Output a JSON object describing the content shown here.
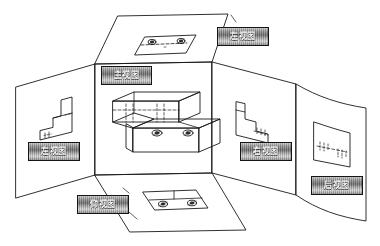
{
  "figure": {
    "type": "engineering-drawing",
    "background_color": "#ffffff",
    "line_color": "#1a1a1a",
    "plate_text_color": "#efefef"
  },
  "labels": {
    "top_view": "俯视图",
    "top_right_view": "左视图",
    "front_view": "主视图",
    "left_view": "左视图",
    "right_view": "右视图",
    "rear_view": "后视图",
    "bottom_view": "仰视图"
  },
  "panels": [
    {
      "name": "top-panel",
      "view": "top",
      "holes": 2,
      "hidden_line": true
    },
    {
      "name": "left-panel",
      "view": "left",
      "holes": 0,
      "hidden_line": true
    },
    {
      "name": "front-panel",
      "view": "front",
      "holes": 2,
      "hidden_line": true
    },
    {
      "name": "right-panel",
      "view": "right",
      "holes": 0,
      "hidden_line": true
    },
    {
      "name": "rear-panel",
      "view": "rear",
      "holes": 0,
      "hidden_line": true
    },
    {
      "name": "bottom-panel",
      "view": "bottom",
      "holes": 2,
      "hidden_line": false
    }
  ],
  "object": {
    "name": "stepped-block",
    "features": [
      "upper step",
      "lower flange",
      "two counterbored holes"
    ],
    "hole_count": 2
  }
}
